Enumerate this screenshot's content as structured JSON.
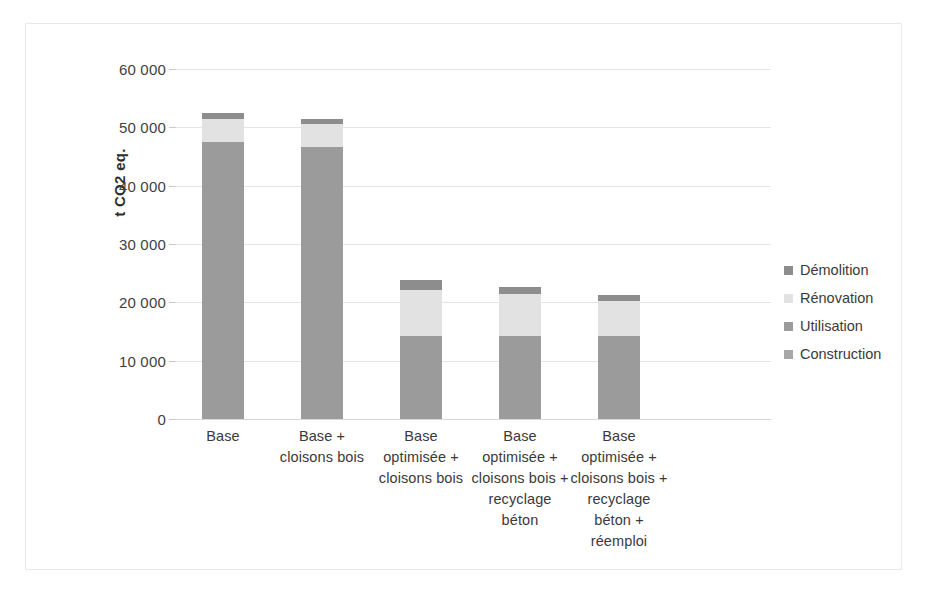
{
  "chart_data": {
    "type": "bar",
    "subtype": "stacked-column",
    "title": "",
    "xlabel": "",
    "ylabel": "t CO2 eq.",
    "ylim": [
      0,
      60000
    ],
    "ytick_values": [
      0,
      10000,
      20000,
      30000,
      40000,
      50000,
      60000
    ],
    "ytick_labels": [
      "0",
      "10 000",
      "20 000",
      "30 000",
      "40 000",
      "50 000",
      "60 000"
    ],
    "grid": true,
    "legend_position": "right",
    "categories": [
      "Base",
      "Base +\ncloisons bois",
      "Base\noptimisée +\ncloisons bois",
      "Base\noptimisée +\ncloisons bois +\nrecyclage\nbéton",
      "Base\noptimisée +\ncloisons bois +\nrecyclage\nbéton +\nréemploi"
    ],
    "category_lines": [
      [
        "Base"
      ],
      [
        "Base +",
        "cloisons bois"
      ],
      [
        "Base",
        "optimisée +",
        "cloisons bois"
      ],
      [
        "Base",
        "optimisée +",
        "cloisons bois +",
        "recyclage",
        "béton"
      ],
      [
        "Base",
        "optimisée +",
        "cloisons bois +",
        "recyclage",
        "béton +",
        "réemploi"
      ]
    ],
    "series": [
      {
        "name": "Construction",
        "color": "#a8a8a8",
        "values": [
          0,
          0,
          0,
          0,
          0
        ]
      },
      {
        "name": "Utilisation",
        "color": "#9b9b9b",
        "values": [
          47500,
          46600,
          14200,
          14200,
          14200
        ]
      },
      {
        "name": "Rénovation",
        "color": "#e2e2e2",
        "values": [
          3900,
          3900,
          7900,
          7200,
          6100
        ]
      },
      {
        "name": "Démolition",
        "color": "#8d8d8d",
        "values": [
          1000,
          900,
          1700,
          1200,
          900
        ]
      }
    ],
    "totals": [
      52400,
      51400,
      23800,
      22600,
      21200
    ],
    "legend_entries": [
      {
        "label": "Démolition",
        "color": "#8d8d8d"
      },
      {
        "label": "Rénovation",
        "color": "#e2e2e2"
      },
      {
        "label": "Utilisation",
        "color": "#9b9b9b"
      },
      {
        "label": "Construction",
        "color": "#a8a8a8"
      }
    ]
  },
  "axis": {
    "y_title": "t CO2 eq.",
    "tick_0": "0",
    "tick_10000": "10 000",
    "tick_20000": "20 000",
    "tick_30000": "30 000",
    "tick_40000": "40 000",
    "tick_50000": "50 000",
    "tick_60000": "60 000"
  },
  "legend": {
    "item_0": "Démolition",
    "item_1": "Rénovation",
    "item_2": "Utilisation",
    "item_3": "Construction"
  },
  "x_labels": {
    "cat_0_line_0": "Base",
    "cat_1_line_0": "Base +",
    "cat_1_line_1": "cloisons bois",
    "cat_2_line_0": "Base",
    "cat_2_line_1": "optimisée +",
    "cat_2_line_2": "cloisons bois",
    "cat_3_line_0": "Base",
    "cat_3_line_1": "optimisée +",
    "cat_3_line_2": "cloisons bois +",
    "cat_3_line_3": "recyclage",
    "cat_3_line_4": "béton",
    "cat_4_line_0": "Base",
    "cat_4_line_1": "optimisée +",
    "cat_4_line_2": "cloisons bois +",
    "cat_4_line_3": "recyclage",
    "cat_4_line_4": "béton +",
    "cat_4_line_5": "réemploi"
  }
}
